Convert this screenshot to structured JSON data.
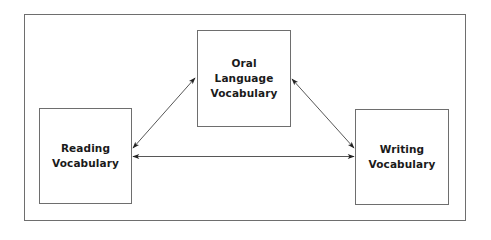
{
  "diagram": {
    "nodes": [
      {
        "id": "reading",
        "lines": [
          "Reading",
          "Vocabulary"
        ]
      },
      {
        "id": "oral",
        "lines": [
          "Oral",
          "Language",
          "Vocabulary"
        ]
      },
      {
        "id": "writing",
        "lines": [
          "Writing",
          "Vocabulary"
        ]
      }
    ],
    "edges": [
      {
        "from": "reading",
        "to": "oral",
        "direction": "bidirectional"
      },
      {
        "from": "oral",
        "to": "writing",
        "direction": "bidirectional"
      },
      {
        "from": "reading",
        "to": "writing",
        "direction": "bidirectional"
      }
    ],
    "colors": {
      "line": "#6e6e6e",
      "text": "#1a1a1a",
      "arrow": "#222222"
    }
  }
}
